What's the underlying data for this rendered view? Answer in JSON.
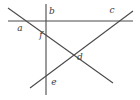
{
  "figure": {
    "type": "geometry-line-diagram",
    "width": 140,
    "height": 100,
    "background_color": "#ffffff",
    "stroke_color": "#4a4a4a",
    "stroke_width": 1.1,
    "label_color": "#3b3b3b",
    "label_font_style": "italic",
    "label_font_size": 9,
    "lines": [
      {
        "name": "vertical-line",
        "x1": 46,
        "y1": 4,
        "x2": 46,
        "y2": 95,
        "orientation": "vertical"
      },
      {
        "name": "horizontal-line",
        "x1": 8,
        "y1": 21,
        "x2": 133,
        "y2": 21,
        "orientation": "horizontal"
      },
      {
        "name": "descending-diagonal",
        "x1": 8,
        "y1": 8,
        "x2": 113,
        "y2": 83,
        "orientation": "descending"
      },
      {
        "name": "ascending-diagonal",
        "x1": 30,
        "y1": 88,
        "x2": 133,
        "y2": 11,
        "orientation": "ascending"
      }
    ],
    "labels": [
      {
        "name": "label-a",
        "text": "a",
        "x": 20,
        "y": 28
      },
      {
        "name": "label-b",
        "text": "b",
        "x": 52,
        "y": 11
      },
      {
        "name": "label-c",
        "text": "c",
        "x": 112,
        "y": 10
      },
      {
        "name": "label-f",
        "text": "f",
        "x": 41,
        "y": 35
      },
      {
        "name": "label-d",
        "text": "d",
        "x": 80,
        "y": 57
      },
      {
        "name": "label-e",
        "text": "e",
        "x": 54,
        "y": 82
      }
    ]
  }
}
